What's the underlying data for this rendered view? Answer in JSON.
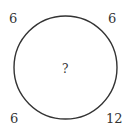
{
  "puzzle": {
    "corners": {
      "top_left": "6",
      "top_right": "6",
      "bottom_left": "6",
      "bottom_right": "12"
    },
    "center": "?"
  },
  "colors": {
    "stroke": "#333333",
    "text": "#333333",
    "background": "#ffffff"
  }
}
